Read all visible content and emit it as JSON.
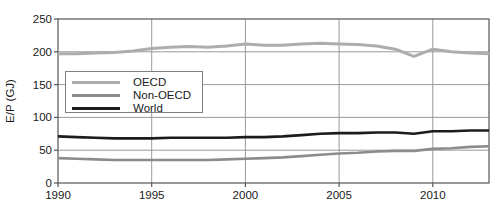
{
  "chart_data": {
    "type": "line",
    "title": "",
    "xlabel": "",
    "ylabel": "E/P (GJ)",
    "xlim": [
      1990,
      2013
    ],
    "ylim": [
      0,
      250
    ],
    "xticks": [
      1990,
      1995,
      2000,
      2005,
      2010
    ],
    "yticks": [
      0,
      50,
      100,
      150,
      200,
      250
    ],
    "grid": true,
    "legend_position": "upper-left-inside",
    "x": [
      1990,
      1991,
      1992,
      1993,
      1994,
      1995,
      1996,
      1997,
      1998,
      1999,
      2000,
      2001,
      2002,
      2003,
      2004,
      2005,
      2006,
      2007,
      2008,
      2009,
      2010,
      2011,
      2012,
      2013
    ],
    "series": [
      {
        "name": "OECD",
        "color": "#adadad",
        "width": 3,
        "values": [
          197,
          197,
          198,
          199,
          201,
          205,
          207,
          208,
          207,
          209,
          212,
          210,
          210,
          212,
          213,
          212,
          211,
          209,
          204,
          193,
          204,
          200,
          198,
          197
        ]
      },
      {
        "name": "Non-OECD",
        "color": "#8c8c8c",
        "width": 2.6,
        "values": [
          38,
          37,
          36,
          35,
          35,
          35,
          35,
          35,
          35,
          36,
          37,
          38,
          39,
          41,
          43,
          45,
          46,
          48,
          49,
          49,
          52,
          53,
          55,
          56
        ]
      },
      {
        "name": "World",
        "color": "#1c1c1c",
        "width": 2.6,
        "values": [
          71,
          70,
          69,
          68,
          68,
          68,
          69,
          69,
          69,
          69,
          70,
          70,
          71,
          73,
          75,
          76,
          76,
          77,
          77,
          75,
          79,
          79,
          80,
          80
        ]
      }
    ]
  },
  "colors": {
    "grid": "#9a9a9a",
    "frame": "#555555",
    "tick": "#555555",
    "text": "#1a1a1a",
    "background": "#ffffff"
  }
}
